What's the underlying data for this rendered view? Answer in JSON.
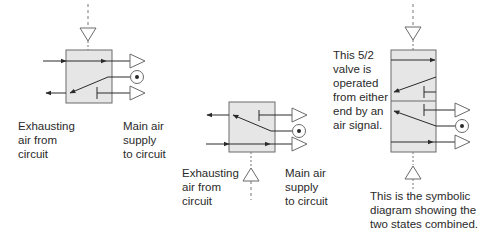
{
  "colors": {
    "line": "#3a3a3a",
    "box_fill": "#e6e6e6",
    "box_stroke": "#6a6a6a",
    "triangle_stroke": "#6a6a6a",
    "text": "#2a2a2a"
  },
  "diagrams": [
    {
      "id": "valve-state-1",
      "labels": {
        "exhaust": "Exhausting\nair from\ncircuit",
        "supply": "Main air\nsupply\nto circuit"
      }
    },
    {
      "id": "valve-state-2",
      "labels": {
        "exhaust": "Exhausting\nair from\ncircuit",
        "supply": "Main air\nsupply\nto circuit"
      }
    },
    {
      "id": "valve-combined",
      "labels": {
        "description": "This 5/2\nvalve is\noperated\nfrom either\nend by an\nair signal.",
        "caption": "This is the symbolic\ndiagram showing the\ntwo states combined."
      }
    }
  ]
}
